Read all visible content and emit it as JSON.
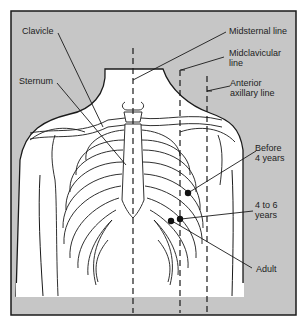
{
  "figure": {
    "background_color": "#c6c6c6",
    "body_color": "#ffffff",
    "line_color": "#1a1a1a",
    "dot_color": "#111111"
  },
  "labels": {
    "clavicle": "Clavicle",
    "sternum": "Sternum",
    "midsternal": "Midsternal line",
    "midclavicular": "Midclavicular\nline",
    "anterior_axillary": "Anterior\naxillary line",
    "before_4": "Before\n4 years",
    "four_to_six": "4 to 6\nyears",
    "adult": "Adult"
  },
  "reference_lines": [
    {
      "name": "Midsternal line",
      "x": 133
    },
    {
      "name": "Midclavicular line",
      "x": 180
    },
    {
      "name": "Anterior axillary line",
      "x": 207
    }
  ],
  "landmarks": [
    {
      "name": "Before 4 years",
      "x": 188,
      "y": 193
    },
    {
      "name": "4 to 6 years",
      "x": 180,
      "y": 219
    },
    {
      "name": "Adult",
      "x": 171,
      "y": 221
    }
  ]
}
